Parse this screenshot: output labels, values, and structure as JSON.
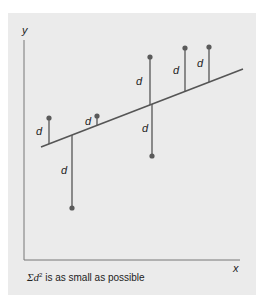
{
  "diagram": {
    "axes": {
      "x_label": "x",
      "y_label": "y"
    },
    "residual_label": "d",
    "caption": {
      "prefix": "Σd",
      "superscript": "2",
      "text": " is as small as possible"
    },
    "colors": {
      "panel": "#ebebeb",
      "line": "#555555",
      "point": "#5a5a5a",
      "axis": "#777777"
    },
    "regression_line": {
      "x1": 41,
      "y1": 147,
      "x2": 243,
      "y2": 69
    },
    "points": [
      {
        "x": 49,
        "point_y": 118,
        "line_y": 144,
        "label_x": 36,
        "label_y": 135
      },
      {
        "x": 97,
        "point_y": 116,
        "line_y": 126,
        "label_x": 85,
        "label_y": 125
      },
      {
        "x": 72,
        "point_y": 208,
        "line_y": 135,
        "label_x": 61,
        "label_y": 174
      },
      {
        "x": 150,
        "point_y": 57,
        "line_y": 105,
        "label_x": 136,
        "label_y": 85
      },
      {
        "x": 152,
        "point_y": 156,
        "line_y": 104,
        "label_x": 142,
        "label_y": 132
      },
      {
        "x": 185,
        "point_y": 48,
        "line_y": 92,
        "label_x": 173,
        "label_y": 74
      },
      {
        "x": 209,
        "point_y": 47,
        "line_y": 82,
        "label_x": 197,
        "label_y": 67
      }
    ]
  }
}
